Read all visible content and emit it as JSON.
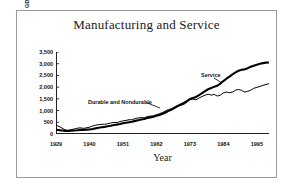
{
  "figure": {
    "title": "Manufacturing and Service",
    "background": "#ffffff",
    "border_color": "#9a9a9a"
  },
  "axes": {
    "x_title": "Year",
    "y_title": "GDP in Billions ($)",
    "x_ticklabels": [
      "1929",
      "1940",
      "1951",
      "1962",
      "1973",
      "1984",
      "1995"
    ],
    "y_ticklabels": [
      "3,500",
      "3,000",
      "2,500",
      "2,000",
      "1,500",
      "1,000",
      "500",
      "0"
    ]
  },
  "annotations": {
    "durable": "Durable and Nondurable",
    "service": "Service"
  },
  "chart_data": {
    "type": "line",
    "title": "Manufacturing and Service",
    "xlabel": "Year",
    "ylabel": "GDP in Billions ($)",
    "xlim": [
      1929,
      1999
    ],
    "ylim": [
      0,
      3500
    ],
    "ytick_values": [
      0,
      500,
      1000,
      1500,
      2000,
      2500,
      3000,
      3500
    ],
    "xtick_values": [
      1929,
      1940,
      1951,
      1962,
      1973,
      1984,
      1995
    ],
    "grid": false,
    "legend": "inline-annotations",
    "x": [
      1929,
      1930,
      1931,
      1932,
      1933,
      1934,
      1935,
      1936,
      1937,
      1938,
      1939,
      1940,
      1941,
      1942,
      1943,
      1944,
      1945,
      1946,
      1947,
      1948,
      1949,
      1950,
      1951,
      1952,
      1953,
      1954,
      1955,
      1956,
      1957,
      1958,
      1959,
      1960,
      1961,
      1962,
      1963,
      1964,
      1965,
      1966,
      1967,
      1968,
      1969,
      1970,
      1971,
      1972,
      1973,
      1974,
      1975,
      1976,
      1977,
      1978,
      1979,
      1980,
      1981,
      1982,
      1983,
      1984,
      1985,
      1986,
      1987,
      1988,
      1989,
      1990,
      1991,
      1992,
      1993,
      1994,
      1995,
      1996,
      1997,
      1998,
      1999
    ],
    "series": [
      {
        "name": "Durable and Nondurable",
        "style": "thin-line",
        "color": "#000000",
        "values": [
          375,
          320,
          250,
          175,
          160,
          185,
          215,
          245,
          265,
          240,
          265,
          290,
          340,
          375,
          400,
          410,
          415,
          440,
          470,
          495,
          485,
          530,
          560,
          580,
          610,
          605,
          660,
          685,
          700,
          690,
          745,
          765,
          775,
          825,
          865,
          915,
          985,
          1045,
          1075,
          1150,
          1205,
          1230,
          1265,
          1350,
          1470,
          1490,
          1460,
          1535,
          1600,
          1660,
          1700,
          1660,
          1690,
          1620,
          1660,
          1755,
          1790,
          1760,
          1790,
          1870,
          1900,
          1860,
          1790,
          1820,
          1870,
          1950,
          1990,
          2030,
          2075,
          2110,
          2150
        ]
      },
      {
        "name": "Service",
        "style": "thick-marker-line",
        "color": "#000000",
        "values": [
          180,
          165,
          150,
          135,
          130,
          140,
          150,
          160,
          175,
          175,
          185,
          195,
          215,
          240,
          265,
          285,
          305,
          330,
          355,
          385,
          400,
          425,
          455,
          480,
          505,
          525,
          560,
          590,
          620,
          640,
          680,
          710,
          735,
          775,
          815,
          865,
          920,
          985,
          1045,
          1120,
          1195,
          1260,
          1325,
          1405,
          1490,
          1540,
          1580,
          1660,
          1745,
          1830,
          1910,
          1960,
          2020,
          2060,
          2150,
          2260,
          2360,
          2450,
          2545,
          2630,
          2700,
          2740,
          2760,
          2810,
          2870,
          2915,
          2960,
          2995,
          3025,
          3045,
          3055
        ]
      }
    ]
  }
}
